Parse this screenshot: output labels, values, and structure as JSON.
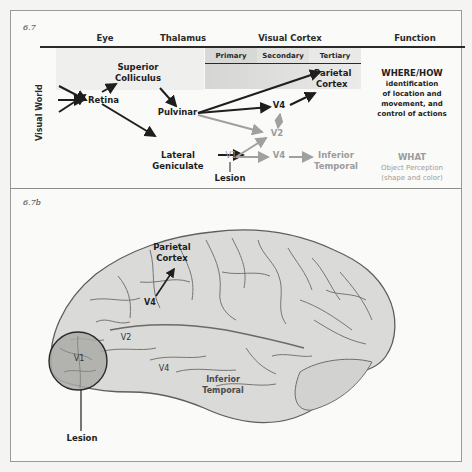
{
  "panel_a": {
    "tag": "6.7",
    "column_headers": {
      "eye": "Eye",
      "thalamus": "Thalamus",
      "visual_cortex": "Visual Cortex",
      "function": "Function"
    },
    "cortex_subheaders": {
      "primary": "Primary",
      "secondary": "Secondary",
      "tertiary": "Tertiary"
    },
    "row_label": "Visual World",
    "nodes": {
      "superior_colliculus_1": "Superior",
      "superior_colliculus_2": "Colliculus",
      "retina": "Retina",
      "pulvinar": "Pulvinar",
      "lateral_geniculate_1": "Lateral",
      "lateral_geniculate_2": "Geniculate",
      "v4_dorsal": "V4",
      "v2": "V2",
      "v1": "V1",
      "v4_ventral": "V4",
      "parietal_cortex_1": "Parietal",
      "parietal_cortex_2": "Cortex",
      "inferior_temporal_1": "Inferior",
      "inferior_temporal_2": "Temporal",
      "lesion": "Lesion"
    },
    "functions": {
      "where_title": "WHERE/HOW",
      "where_lines": [
        "identification",
        "of location and",
        "movement, and",
        "control of actions"
      ],
      "what_title": "WHAT",
      "what_lines": [
        "Object Perception",
        "(shape and color)"
      ]
    },
    "colors": {
      "active_path": "#1e1e1e",
      "lesioned_path": "#a0a0a0",
      "cortex_shade": "#e2e2e0"
    }
  },
  "panel_b": {
    "tag": "6.7b",
    "labels": {
      "parietal_1": "Parietal",
      "parietal_2": "Cortex",
      "v4_dorsal": "V4",
      "v2": "V2",
      "v1": "V1",
      "v4_ventral": "V4",
      "inferior_1": "Inferior",
      "inferior_2": "Temporal",
      "lesion": "Lesion"
    },
    "colors": {
      "brain_fill": "#d9d9d7",
      "sulci": "#6e6e6c",
      "lesion_fill": "#a9a9a7"
    }
  }
}
